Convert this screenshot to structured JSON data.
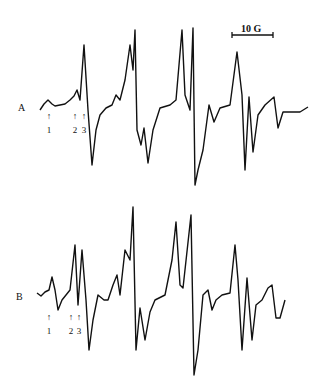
{
  "chart_data": {
    "type": "line",
    "title": "",
    "xlabel": "Magnetic field",
    "ylabel": "",
    "grid": false,
    "scale_bar": {
      "label": "10 G"
    },
    "series": [
      {
        "name": "A",
        "markers": [
          "1",
          "2",
          "3"
        ],
        "points": [
          [
            40,
            110
          ],
          [
            44,
            104
          ],
          [
            48,
            100
          ],
          [
            52,
            104
          ],
          [
            55,
            106
          ],
          [
            60,
            105
          ],
          [
            65,
            104
          ],
          [
            70,
            100
          ],
          [
            74,
            96
          ],
          [
            77,
            90
          ],
          [
            80,
            100
          ],
          [
            84,
            45
          ],
          [
            88,
            110
          ],
          [
            92,
            165
          ],
          [
            96,
            130
          ],
          [
            100,
            115
          ],
          [
            106,
            108
          ],
          [
            112,
            105
          ],
          [
            116,
            95
          ],
          [
            120,
            100
          ],
          [
            125,
            80
          ],
          [
            130,
            45
          ],
          [
            133,
            70
          ],
          [
            135,
            30
          ],
          [
            137,
            130
          ],
          [
            141,
            145
          ],
          [
            144,
            128
          ],
          [
            148,
            163
          ],
          [
            153,
            130
          ],
          [
            160,
            108
          ],
          [
            170,
            105
          ],
          [
            176,
            100
          ],
          [
            182,
            30
          ],
          [
            185,
            95
          ],
          [
            190,
            110
          ],
          [
            193,
            28
          ],
          [
            195,
            185
          ],
          [
            198,
            170
          ],
          [
            203,
            150
          ],
          [
            209,
            105
          ],
          [
            214,
            122
          ],
          [
            220,
            108
          ],
          [
            230,
            105
          ],
          [
            237,
            52
          ],
          [
            242,
            95
          ],
          [
            245,
            170
          ],
          [
            249,
            97
          ],
          [
            253,
            152
          ],
          [
            258,
            115
          ],
          [
            265,
            105
          ],
          [
            274,
            97
          ],
          [
            278,
            128
          ],
          [
            283,
            112
          ],
          [
            290,
            112
          ],
          [
            300,
            112
          ],
          [
            308,
            107
          ]
        ]
      },
      {
        "name": "B",
        "markers": [
          "1",
          "2",
          "3"
        ],
        "points": [
          [
            37,
            293
          ],
          [
            41,
            296
          ],
          [
            45,
            292
          ],
          [
            49,
            290
          ],
          [
            52,
            277
          ],
          [
            55,
            290
          ],
          [
            58,
            310
          ],
          [
            62,
            300
          ],
          [
            66,
            295
          ],
          [
            70,
            290
          ],
          [
            75,
            245
          ],
          [
            78,
            305
          ],
          [
            82,
            250
          ],
          [
            86,
            300
          ],
          [
            89,
            350
          ],
          [
            93,
            320
          ],
          [
            98,
            295
          ],
          [
            104,
            300
          ],
          [
            108,
            300
          ],
          [
            113,
            285
          ],
          [
            117,
            275
          ],
          [
            120,
            295
          ],
          [
            125,
            250
          ],
          [
            130,
            260
          ],
          [
            133,
            207
          ],
          [
            136,
            350
          ],
          [
            140,
            308
          ],
          [
            145,
            340
          ],
          [
            150,
            312
          ],
          [
            155,
            300
          ],
          [
            165,
            295
          ],
          [
            172,
            260
          ],
          [
            176,
            222
          ],
          [
            180,
            285
          ],
          [
            183,
            288
          ],
          [
            191,
            215
          ],
          [
            194,
            375
          ],
          [
            198,
            350
          ],
          [
            203,
            295
          ],
          [
            208,
            290
          ],
          [
            212,
            310
          ],
          [
            216,
            300
          ],
          [
            222,
            295
          ],
          [
            230,
            293
          ],
          [
            235,
            245
          ],
          [
            238,
            280
          ],
          [
            242,
            350
          ],
          [
            247,
            278
          ],
          [
            252,
            340
          ],
          [
            256,
            305
          ],
          [
            262,
            300
          ],
          [
            268,
            288
          ],
          [
            272,
            285
          ],
          [
            276,
            318
          ],
          [
            280,
            318
          ],
          [
            285,
            300
          ]
        ]
      }
    ]
  },
  "labels": {
    "trace_a": "A",
    "trace_b": "B",
    "scale": "10 G",
    "m1": "1",
    "m2": "2",
    "m3": "3",
    "arrow": "↑"
  }
}
